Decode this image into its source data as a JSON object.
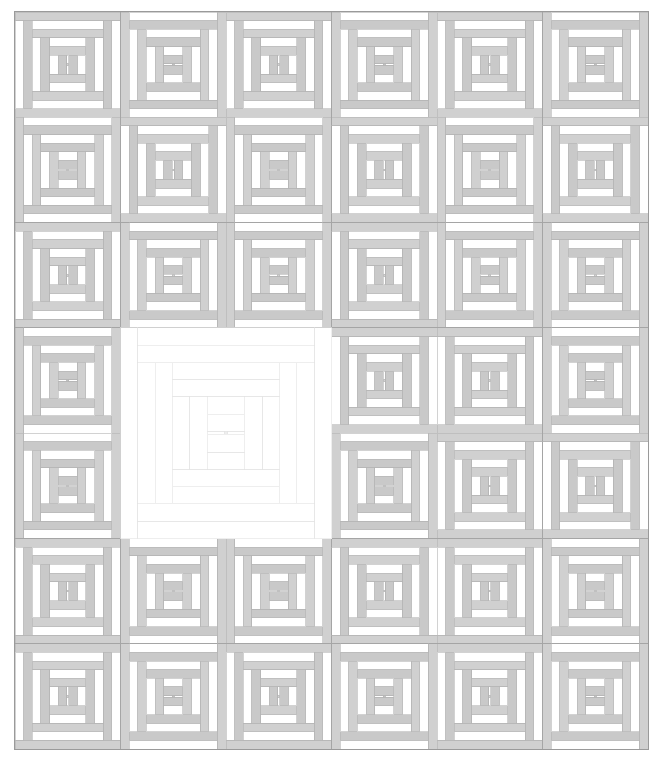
{
  "artwork": {
    "title": "Courthouse Steps Quilt",
    "type": "quilt-pattern-diagram",
    "canvas": {
      "width": 663,
      "height": 765
    },
    "background_color": "#ffffff"
  },
  "palette": {
    "background": "#ffffff",
    "light": "#ffffff",
    "dark": "#d0d0d0",
    "dark_alt": "#c9c9c9",
    "mid": "#dcdcdc",
    "outline": "#b4b4b4",
    "block_border": "#909090",
    "quilt_border": "#9a9a9a",
    "faint_line": "#e2e2e2"
  },
  "grid": {
    "columns": 6,
    "rows": 7,
    "left": 15,
    "top": 12,
    "cell_width": 105.5,
    "cell_height": 105.3,
    "gutter": 0,
    "border_width": 1,
    "label": "6 columns by 7 rows of pieced blocks"
  },
  "block_style": {
    "ring_count": 6,
    "ring_thickness_fraction": 0.082,
    "center_label": "3-part center bar",
    "orientation_horizontal": "dark logs on top and bottom, light logs on left and right",
    "orientation_vertical": "dark logs on left and right, light logs on top and bottom"
  },
  "blocks": [
    {
      "row": 0,
      "col": 0,
      "orientation": "horizontal",
      "fill": "shaded"
    },
    {
      "row": 0,
      "col": 1,
      "orientation": "vertical",
      "fill": "shaded"
    },
    {
      "row": 0,
      "col": 2,
      "orientation": "horizontal",
      "fill": "shaded"
    },
    {
      "row": 0,
      "col": 3,
      "orientation": "vertical",
      "fill": "shaded"
    },
    {
      "row": 0,
      "col": 4,
      "orientation": "horizontal",
      "fill": "shaded"
    },
    {
      "row": 0,
      "col": 5,
      "orientation": "vertical",
      "fill": "shaded"
    },
    {
      "row": 1,
      "col": 0,
      "orientation": "vertical",
      "fill": "shaded"
    },
    {
      "row": 1,
      "col": 1,
      "orientation": "horizontal",
      "fill": "shaded"
    },
    {
      "row": 1,
      "col": 2,
      "orientation": "vertical",
      "fill": "shaded"
    },
    {
      "row": 1,
      "col": 3,
      "orientation": "horizontal",
      "fill": "shaded"
    },
    {
      "row": 1,
      "col": 4,
      "orientation": "vertical",
      "fill": "shaded"
    },
    {
      "row": 1,
      "col": 5,
      "orientation": "horizontal",
      "fill": "shaded"
    },
    {
      "row": 2,
      "col": 0,
      "orientation": "horizontal",
      "fill": "shaded"
    },
    {
      "row": 2,
      "col": 1,
      "orientation": "vertical",
      "fill": "shaded"
    },
    {
      "row": 2,
      "col": 2,
      "orientation": "vertical",
      "fill": "shaded"
    },
    {
      "row": 2,
      "col": 3,
      "orientation": "horizontal",
      "fill": "shaded"
    },
    {
      "row": 2,
      "col": 4,
      "orientation": "vertical",
      "fill": "shaded"
    },
    {
      "row": 2,
      "col": 5,
      "orientation": "vertical",
      "fill": "shaded"
    },
    {
      "row": 3,
      "col": 0,
      "orientation": "vertical",
      "fill": "shaded"
    },
    {
      "row": 3,
      "col": 3,
      "orientation": "horizontal",
      "fill": "shaded"
    },
    {
      "row": 3,
      "col": 4,
      "orientation": "horizontal",
      "fill": "shaded"
    },
    {
      "row": 3,
      "col": 5,
      "orientation": "vertical",
      "fill": "shaded"
    },
    {
      "row": 4,
      "col": 0,
      "orientation": "vertical",
      "fill": "shaded"
    },
    {
      "row": 4,
      "col": 3,
      "orientation": "vertical",
      "fill": "shaded"
    },
    {
      "row": 4,
      "col": 4,
      "orientation": "horizontal",
      "fill": "shaded"
    },
    {
      "row": 4,
      "col": 5,
      "orientation": "horizontal",
      "fill": "shaded"
    },
    {
      "row": 5,
      "col": 0,
      "orientation": "horizontal",
      "fill": "shaded"
    },
    {
      "row": 5,
      "col": 1,
      "orientation": "vertical",
      "fill": "shaded"
    },
    {
      "row": 5,
      "col": 2,
      "orientation": "vertical",
      "fill": "shaded"
    },
    {
      "row": 5,
      "col": 3,
      "orientation": "horizontal",
      "fill": "shaded"
    },
    {
      "row": 5,
      "col": 4,
      "orientation": "horizontal",
      "fill": "shaded"
    },
    {
      "row": 5,
      "col": 5,
      "orientation": "vertical",
      "fill": "shaded"
    },
    {
      "row": 6,
      "col": 0,
      "orientation": "horizontal",
      "fill": "shaded"
    },
    {
      "row": 6,
      "col": 1,
      "orientation": "vertical",
      "fill": "shaded"
    },
    {
      "row": 6,
      "col": 2,
      "orientation": "horizontal",
      "fill": "shaded"
    },
    {
      "row": 6,
      "col": 3,
      "orientation": "vertical",
      "fill": "shaded"
    },
    {
      "row": 6,
      "col": 4,
      "orientation": "horizontal",
      "fill": "shaded"
    },
    {
      "row": 6,
      "col": 5,
      "orientation": "vertical",
      "fill": "shaded"
    }
  ],
  "feature_block": {
    "label": "center white medallion block",
    "row": 3,
    "col": 1,
    "row_span": 2,
    "col_span": 2,
    "orientation": "vertical",
    "fill": "outline-only",
    "description": "large two-by-two blank block drawn in outline only"
  }
}
